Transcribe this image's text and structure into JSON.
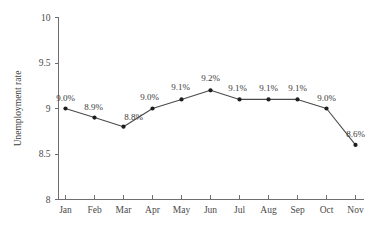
{
  "chart_data": {
    "type": "line",
    "title": "",
    "subtitle": "",
    "xlabel": "",
    "ylabel": "Unemployment rate",
    "categories": [
      "Jan",
      "Feb",
      "Mar",
      "Apr",
      "May",
      "Jun",
      "Jul",
      "Aug",
      "Sep",
      "Oct",
      "Nov"
    ],
    "values": [
      9.0,
      8.9,
      8.8,
      9.0,
      9.1,
      9.2,
      9.1,
      9.1,
      9.1,
      9.0,
      8.6
    ],
    "point_labels": [
      "9.0%",
      "8.9%",
      "8.8%",
      "9.0%",
      "9.1%",
      "9.2%",
      "9.1%",
      "9.1%",
      "9.1%",
      "9.0%",
      "8.6%"
    ],
    "ylim": [
      8,
      10
    ],
    "yticks": [
      8,
      8.5,
      9,
      9.5,
      10
    ],
    "ytick_labels": [
      "8",
      "8.5",
      "9",
      "9.5",
      "10"
    ],
    "grid": false,
    "legend": false,
    "legend_position": "none",
    "series": [
      {
        "name": "Unemployment rate",
        "values": [
          9.0,
          8.9,
          8.8,
          9.0,
          9.1,
          9.2,
          9.1,
          9.1,
          9.1,
          9.0,
          8.6
        ]
      }
    ],
    "colors": {
      "line": "#4a4a4a",
      "marker": "#1e1e1e",
      "axis": "#6e6e6e",
      "text": "#3a3a3a",
      "background": "#ffffff"
    },
    "label_offsets": [
      {
        "dx": 0,
        "dy": -8
      },
      {
        "dx": -1,
        "dy": -8
      },
      {
        "dx": 10,
        "dy": -7
      },
      {
        "dx": -3,
        "dy": -9
      },
      {
        "dx": -1,
        "dy": -9
      },
      {
        "dx": 0,
        "dy": -9
      },
      {
        "dx": -2,
        "dy": -8
      },
      {
        "dx": 0,
        "dy": -8
      },
      {
        "dx": 0,
        "dy": -8
      },
      {
        "dx": 0,
        "dy": -8
      },
      {
        "dx": 0,
        "dy": -8
      }
    ]
  }
}
